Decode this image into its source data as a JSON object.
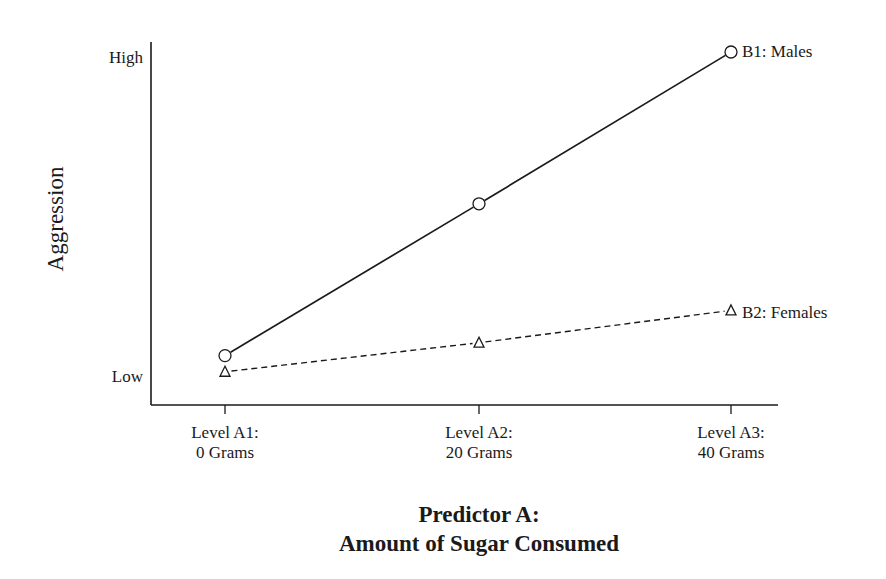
{
  "chart_data": {
    "type": "line",
    "title": "",
    "xlabel": "Predictor A: Amount of Sugar Consumed",
    "xlabel_lines": [
      "Predictor A:",
      "Amount of Sugar Consumed"
    ],
    "ylabel": "Aggression",
    "categories": [
      "Level A1: 0 Grams",
      "Level A2: 20 Grams",
      "Level A3: 40 Grams"
    ],
    "category_lines": [
      [
        "Level A1:",
        "0 Grams"
      ],
      [
        "Level A2:",
        "20 Grams"
      ],
      [
        "Level A3:",
        "40 Grams"
      ]
    ],
    "y_ticks": [
      {
        "label": "Low",
        "value": 0
      },
      {
        "label": "High",
        "value": 10
      }
    ],
    "ylim": [
      0,
      10
    ],
    "grid": false,
    "legend_position": "inline-right-end",
    "series": [
      {
        "name": "B1: Males",
        "marker": "circle",
        "line_style": "solid",
        "values": [
          0.6,
          5.3,
          10.0
        ]
      },
      {
        "name": "B2: Females",
        "marker": "triangle",
        "line_style": "dashed",
        "values": [
          0.1,
          1.0,
          2.0
        ]
      }
    ]
  },
  "colors": {
    "ink": "#1a1a1a",
    "background": "#ffffff"
  }
}
